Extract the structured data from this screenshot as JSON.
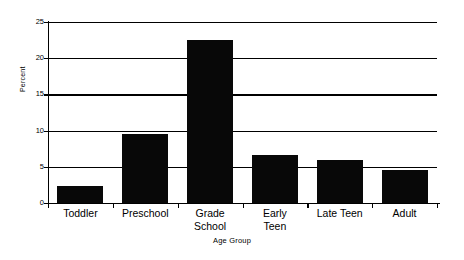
{
  "chart_data": {
    "type": "bar",
    "title": "",
    "subtitle": "",
    "xlabel": "Age Group",
    "ylabel": "Percent",
    "categories": [
      "Toddler",
      "Preschool",
      "Grade School",
      "Early Teen",
      "Late Teen",
      "Adult"
    ],
    "category_lines": [
      [
        "Toddler"
      ],
      [
        "Preschool"
      ],
      [
        "Grade",
        "School"
      ],
      [
        "Early",
        "Teen"
      ],
      [
        "Late Teen"
      ],
      [
        "Adult"
      ]
    ],
    "values": [
      2.4,
      9.5,
      22.5,
      6.6,
      6.0,
      4.5
    ],
    "ylim": [
      0,
      25
    ],
    "yticks": [
      0,
      5,
      10,
      15,
      20,
      25
    ],
    "ytick_labels": [
      "0",
      "5",
      "10",
      "15",
      "20",
      "25"
    ],
    "grid": true,
    "grid_axis": "y",
    "legend": false,
    "legend_position": "none",
    "bar_color": "#080808",
    "background_color": "#ffffff",
    "axis_color": "#000000"
  },
  "axes": {
    "y_title": "Percent",
    "x_title": "Age Group"
  }
}
